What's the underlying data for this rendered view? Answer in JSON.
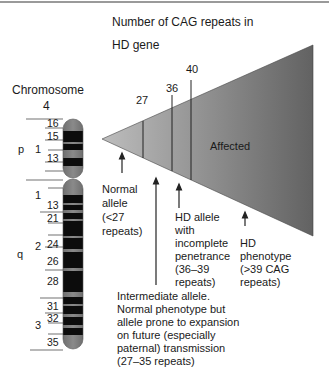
{
  "title": {
    "line1": "Number of CAG repeats in",
    "line2": "HD gene"
  },
  "chromosome": {
    "title": "Chromosome",
    "number": "4",
    "arm_p": "p",
    "arm_q": "q",
    "region_p1": "1",
    "region_q1": "1",
    "region_q2": "2",
    "region_q3": "3",
    "bands": [
      "16",
      "15",
      "13",
      "13",
      "21",
      "24",
      "26",
      "28",
      "31",
      "32",
      "35"
    ]
  },
  "triangle": {
    "thresholds": [
      "27",
      "36",
      "40"
    ],
    "affected_label": "Affected",
    "colors": {
      "light": "#b8b8b8",
      "dark": "#6a6a6a"
    }
  },
  "annotations": {
    "normal": [
      "Normal",
      "allele",
      "(<27",
      "repeats)"
    ],
    "incomplete": [
      "HD allele",
      "with",
      "incomplete",
      "penetrance",
      "(36–39",
      "repeats)"
    ],
    "phenotype": [
      "HD",
      "phenotype",
      "(>39 CAG",
      "repeats)"
    ],
    "intermediate": [
      "Intermediate allele.",
      "Normal phenotype but",
      "allele prone to expansion",
      "on future (especially",
      "paternal) transmission",
      "(27–35 repeats)"
    ]
  }
}
